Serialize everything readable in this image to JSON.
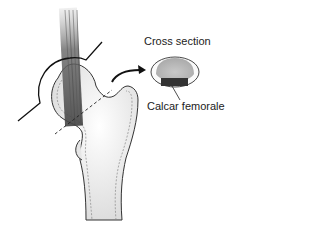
{
  "diagram": {
    "labels": {
      "cross_section": "Cross section",
      "calcar": "Calcar femorale"
    },
    "colors": {
      "outline": "#222222",
      "bone_fill": "#f2f2f2",
      "cortex": "#bdbdbd",
      "trabecular": "#b8b8b8",
      "calcar": "#333333"
    }
  }
}
